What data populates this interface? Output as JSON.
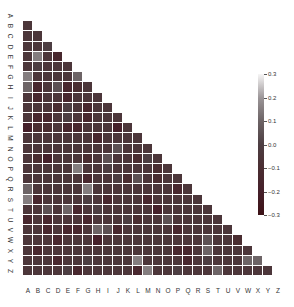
{
  "chart_data": {
    "type": "heatmap",
    "title": "",
    "xlabel": "",
    "ylabel": "",
    "layout": "lower-triangle",
    "row_labels": [
      "A",
      "B",
      "C",
      "D",
      "E",
      "F",
      "G",
      "H",
      "I",
      "J",
      "K",
      "L",
      "M",
      "N",
      "O",
      "P",
      "Q",
      "R",
      "S",
      "T",
      "U",
      "V",
      "W",
      "X",
      "Y",
      "Z"
    ],
    "col_labels": [
      "A",
      "B",
      "C",
      "D",
      "E",
      "F",
      "G",
      "H",
      "I",
      "J",
      "K",
      "L",
      "M",
      "N",
      "O",
      "P",
      "Q",
      "R",
      "S",
      "T",
      "U",
      "V",
      "W",
      "X",
      "Y",
      "Z"
    ],
    "rows": [
      [],
      [
        -0.05
      ],
      [
        -0.05,
        -0.05
      ],
      [
        -0.05,
        -0.05,
        0.0
      ],
      [
        -0.05,
        0.15,
        -0.05,
        -0.15
      ],
      [
        -0.05,
        0.0,
        -0.05,
        -0.05,
        -0.05
      ],
      [
        0.15,
        -0.05,
        -0.05,
        -0.05,
        -0.05,
        0.1
      ],
      [
        0.1,
        -0.15,
        -0.05,
        0.05,
        -0.15,
        -0.1,
        -0.05
      ],
      [
        -0.05,
        -0.15,
        -0.05,
        -0.05,
        -0.15,
        -0.05,
        -0.05,
        -0.05
      ],
      [
        -0.05,
        -0.05,
        -0.05,
        -0.1,
        0.0,
        -0.05,
        -0.15,
        -0.05,
        -0.05
      ],
      [
        -0.05,
        -0.15,
        -0.15,
        -0.05,
        0.0,
        -0.05,
        -0.15,
        -0.05,
        -0.05,
        -0.05
      ],
      [
        -0.2,
        -0.1,
        -0.1,
        -0.05,
        -0.15,
        -0.15,
        -0.05,
        -0.05,
        -0.05,
        -0.2,
        -0.05
      ],
      [
        -0.05,
        -0.05,
        -0.05,
        -0.05,
        -0.05,
        -0.05,
        -0.05,
        -0.15,
        -0.05,
        -0.05,
        -0.05,
        -0.05
      ],
      [
        -0.05,
        -0.05,
        -0.05,
        -0.05,
        -0.05,
        -0.05,
        -0.05,
        -0.05,
        -0.05,
        0.05,
        -0.05,
        -0.05,
        -0.05
      ],
      [
        -0.05,
        -0.1,
        -0.2,
        -0.05,
        -0.05,
        -0.05,
        -0.1,
        -0.05,
        0.05,
        -0.05,
        -0.05,
        -0.1,
        0.0,
        -0.05
      ],
      [
        -0.05,
        -0.05,
        -0.05,
        -0.05,
        -0.05,
        0.15,
        -0.05,
        -0.05,
        0.0,
        -0.05,
        -0.05,
        -0.05,
        -0.05,
        -0.1,
        -0.05
      ],
      [
        -0.05,
        -0.05,
        -0.05,
        -0.05,
        -0.05,
        -0.05,
        -0.15,
        -0.05,
        -0.05,
        0.0,
        -0.1,
        0.05,
        -0.05,
        -0.1,
        -0.05,
        -0.05
      ],
      [
        0.1,
        -0.05,
        -0.05,
        -0.05,
        -0.05,
        -0.05,
        0.15,
        -0.05,
        -0.05,
        -0.05,
        -0.05,
        -0.05,
        -0.05,
        -0.05,
        -0.05,
        -0.15,
        -0.05
      ],
      [
        0.15,
        -0.15,
        -0.05,
        -0.05,
        -0.05,
        -0.05,
        0.0,
        -0.05,
        -0.15,
        -0.05,
        -0.05,
        -0.05,
        -0.15,
        -0.05,
        -0.05,
        -0.05,
        -0.05,
        -0.05
      ],
      [
        -0.05,
        -0.05,
        0.05,
        -0.05,
        0.1,
        -0.15,
        -0.05,
        0.0,
        -0.05,
        -0.05,
        -0.05,
        -0.05,
        -0.05,
        -0.2,
        -0.05,
        -0.05,
        -0.05,
        -0.05,
        -0.05
      ],
      [
        -0.15,
        -0.05,
        -0.15,
        -0.05,
        -0.05,
        -0.05,
        -0.15,
        -0.05,
        -0.05,
        -0.05,
        0.0,
        -0.1,
        -0.05,
        -0.05,
        0.05,
        -0.05,
        -0.05,
        -0.05,
        -0.05,
        -0.05
      ],
      [
        -0.05,
        -0.05,
        -0.15,
        -0.05,
        -0.15,
        -0.15,
        -0.05,
        0.1,
        0.05,
        -0.15,
        -0.05,
        -0.05,
        -0.05,
        -0.05,
        -0.05,
        -0.15,
        -0.05,
        -0.05,
        -0.05,
        -0.05,
        -0.05
      ],
      [
        -0.05,
        -0.05,
        -0.05,
        -0.15,
        -0.05,
        -0.05,
        -0.05,
        -0.2,
        -0.05,
        -0.05,
        -0.05,
        -0.05,
        -0.05,
        -0.05,
        -0.05,
        -0.05,
        -0.05,
        -0.05,
        0.05,
        -0.05,
        -0.05,
        -0.1
      ],
      [
        -0.05,
        -0.15,
        -0.05,
        -0.05,
        -0.05,
        -0.05,
        -0.05,
        -0.05,
        -0.05,
        -0.05,
        -0.05,
        -0.05,
        -0.05,
        -0.05,
        -0.05,
        -0.15,
        -0.15,
        -0.05,
        0.1,
        -0.05,
        -0.05,
        -0.05,
        -0.05
      ],
      [
        -0.05,
        -0.05,
        -0.05,
        -0.15,
        -0.05,
        -0.05,
        0.0,
        -0.05,
        -0.05,
        -0.05,
        -0.05,
        0.15,
        -0.05,
        -0.05,
        -0.05,
        -0.05,
        -0.15,
        -0.05,
        0.0,
        -0.05,
        -0.05,
        -0.05,
        0.1,
        0.1
      ],
      [
        -0.05,
        -0.05,
        -0.05,
        -0.05,
        0.0,
        -0.15,
        -0.05,
        -0.05,
        -0.05,
        -0.05,
        -0.05,
        -0.15,
        0.15,
        -0.05,
        -0.05,
        0.0,
        -0.05,
        -0.05,
        -0.05,
        0.1,
        -0.05,
        -0.05,
        -0.05,
        -0.05,
        -0.05
      ]
    ],
    "colorbar": {
      "ticks": [
        "0.3",
        "0.2",
        "0.1",
        "0.0",
        "−0.1",
        "−0.2",
        "−0.3"
      ],
      "vmin": -0.3,
      "vmax": 0.3,
      "colors": [
        "#3d1216",
        "#45202a",
        "#4a2d31",
        "#4d3e42",
        "#6d6466",
        "#9b9597",
        "#f7f6f6"
      ]
    },
    "grid": false,
    "legend_position": "right"
  }
}
